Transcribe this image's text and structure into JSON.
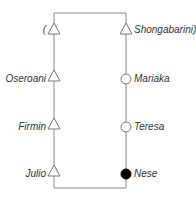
{
  "diagram": {
    "type": "genealogy",
    "left_line": [
      {
        "name": "(",
        "symbol": "triangle"
      },
      {
        "name": "Oseroani",
        "symbol": "triangle"
      },
      {
        "name": "Firmin",
        "symbol": "triangle"
      },
      {
        "name": "Julio",
        "symbol": "triangle"
      }
    ],
    "right_line": [
      {
        "name": "Shongabarini)",
        "symbol": "circle-open"
      },
      {
        "name": "Mariaka",
        "symbol": "circle-open"
      },
      {
        "name": "Teresa",
        "symbol": "circle-open"
      },
      {
        "name": "Nese",
        "symbol": "circle-filled"
      }
    ],
    "right_top_symbol": "triangle",
    "colors": {
      "line": "#777777",
      "text": "#333333",
      "filled": "#000000"
    }
  }
}
